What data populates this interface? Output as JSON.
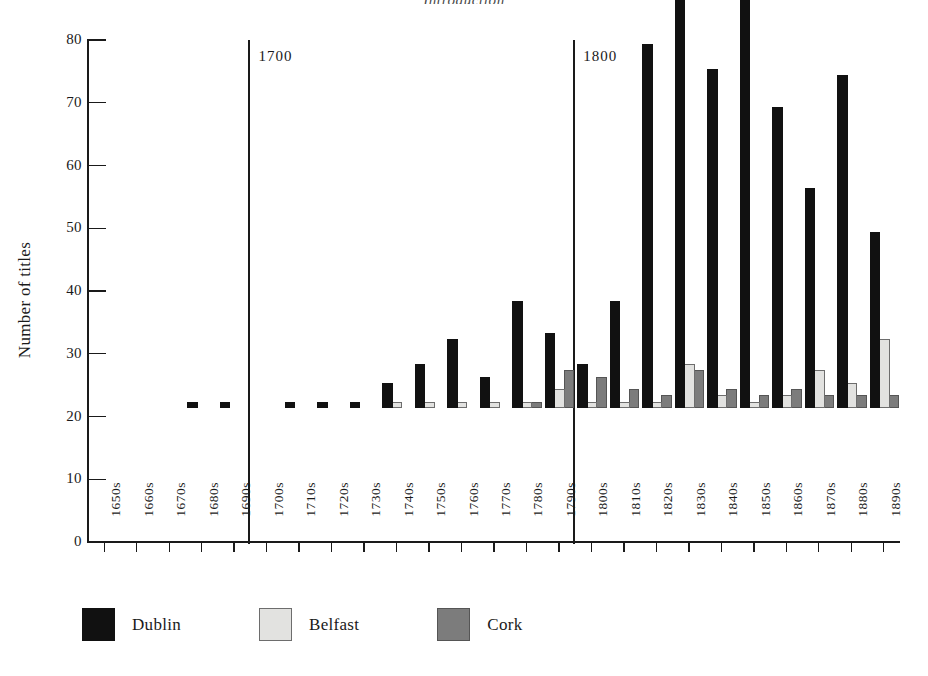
{
  "running_head": "Introduction",
  "chart_data": {
    "type": "bar",
    "title": "",
    "xlabel": "",
    "ylabel": "Number of titles",
    "ylim": [
      0,
      80
    ],
    "ytick_step": 10,
    "ytick_labels": [
      "80",
      "70",
      "60",
      "50",
      "40",
      "30",
      "20",
      "10",
      "0"
    ],
    "ytick_values": [
      80,
      70,
      60,
      50,
      40,
      30,
      20,
      10,
      0
    ],
    "grid": false,
    "legend_position": "below-axis-left",
    "categories": [
      "1650s",
      "1660s",
      "1670s",
      "1680s",
      "1690s",
      "1700s",
      "1710s",
      "1720s",
      "1730s",
      "1740s",
      "1750s",
      "1760s",
      "1770s",
      "1780s",
      "1790s",
      "1800s",
      "1810s",
      "1820s",
      "1830s",
      "1840s",
      "1850s",
      "1860s",
      "1870s",
      "1880s",
      "1890s"
    ],
    "series": [
      {
        "name": "Dublin",
        "color": "#111111",
        "values": [
          0,
          0,
          0,
          1,
          1,
          0,
          1,
          1,
          1,
          4,
          7,
          11,
          5,
          17,
          12,
          7,
          17,
          58,
          68,
          54,
          72,
          48,
          35,
          53,
          28
        ]
      },
      {
        "name": "Belfast",
        "color": "#e2e2e0",
        "values": [
          0,
          0,
          0,
          0,
          0,
          0,
          0,
          0,
          0,
          1,
          1,
          1,
          1,
          1,
          3,
          1,
          1,
          1,
          7,
          2,
          1,
          2,
          6,
          4,
          11
        ]
      },
      {
        "name": "Cork",
        "color": "#7c7c7c",
        "values": [
          0,
          0,
          0,
          0,
          0,
          0,
          0,
          0,
          0,
          0,
          0,
          0,
          0,
          1,
          6,
          5,
          3,
          2,
          6,
          3,
          2,
          3,
          2,
          2,
          2
        ]
      }
    ],
    "annotations": [
      {
        "label": "1700",
        "at_category": "1700s",
        "type": "era-divider"
      },
      {
        "label": "1800",
        "at_category": "1800s",
        "type": "era-divider"
      }
    ]
  },
  "legend": {
    "items": [
      {
        "label": "Dublin",
        "swatch": "black-square-swatch"
      },
      {
        "label": "Belfast",
        "swatch": "light-gray-square-swatch"
      },
      {
        "label": "Cork",
        "swatch": "dark-gray-square-swatch"
      }
    ]
  }
}
